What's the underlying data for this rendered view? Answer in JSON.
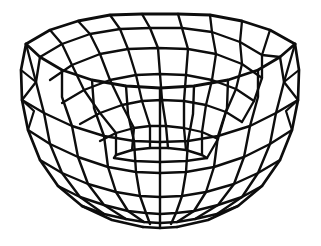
{
  "figure": {
    "style": "hand-drawn ink line drawing",
    "background_color": "#ffffff",
    "line_color": "#0d0d0d",
    "fill": "none",
    "stroke_width_outer": 2.6,
    "stroke_width_inner": 2.2,
    "stroke_width_rim": 2.8,
    "canvas": {
      "width": 321,
      "height": 246
    }
  },
  "geometry": {
    "type": "lat-long-wireframe-hemisphere",
    "center_x": 160,
    "rim_center_y": 62,
    "rim_radius_x": 140,
    "rim_radius_y": 47,
    "depth": 166,
    "bottom_y": 228,
    "meridian_count": 16,
    "visible_meridian_count": 16,
    "latitude_ring_count_interior": 5,
    "latitude_ring_count_exterior": 5,
    "inner_ring_radius_x": 36,
    "inner_ring_radius_y": 11,
    "left_silhouette_x": 21,
    "right_silhouette_x": 299,
    "top_rim_y": 14,
    "interior_visible": true,
    "polygonal_faceting": true
  },
  "rings": {
    "labels": [
      "rim",
      "ring-1",
      "ring-2",
      "ring-3",
      "ring-4",
      "base-ring"
    ],
    "interior_ring_y": [
      62,
      92,
      117,
      137,
      151,
      158
    ],
    "exterior_ring_y": [
      62,
      118,
      158,
      189,
      211,
      228
    ]
  },
  "annotations": {
    "has_text": false,
    "has_axes": false,
    "has_legend": false
  }
}
